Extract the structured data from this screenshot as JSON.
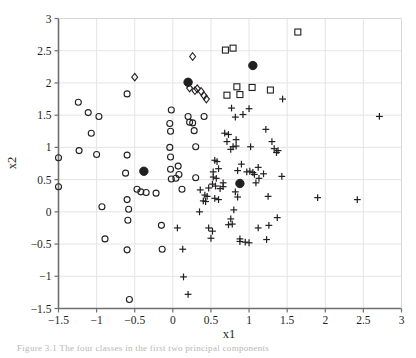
{
  "figure": {
    "background_color": "#ffffff",
    "axis_color": "#6f6f6f",
    "grid_color": "#e4e4e4",
    "marker_color": "#231f20",
    "caption": "Figure 3.1   The four classes in the first two principal components"
  },
  "chart_data": {
    "type": "scatter",
    "title": "",
    "xlabel": "x1",
    "ylabel": "x2",
    "xlim": [
      -1.5,
      3
    ],
    "ylim": [
      -1.5,
      3
    ],
    "xticks": [
      -1.5,
      -1,
      -0.5,
      0,
      0.5,
      1,
      1.5,
      2,
      2.5,
      3
    ],
    "xticklabels": [
      "-1.5",
      "-1",
      "-0.5",
      "0",
      "0.5",
      "1",
      "1.5",
      "2",
      "2.5",
      "3"
    ],
    "yticks": [
      -1.5,
      -1,
      -0.5,
      0,
      0.5,
      1,
      1.5,
      2,
      2.5,
      3
    ],
    "yticklabels": [
      "-1.5",
      "-1",
      "-0.5",
      "0",
      "0.5",
      "1",
      "1.5",
      "2",
      "2.5",
      "3"
    ],
    "grid": true,
    "legend": "none",
    "series": [
      {
        "name": "circle-class",
        "marker": "circle-open",
        "points": [
          [
            -1.5,
            0.84
          ],
          [
            -1.5,
            0.39
          ],
          [
            -1.24,
            1.7
          ],
          [
            -1.23,
            0.95
          ],
          [
            -1.11,
            1.54
          ],
          [
            -1.07,
            1.22
          ],
          [
            -1.0,
            0.89
          ],
          [
            -0.97,
            1.48
          ],
          [
            -0.93,
            0.08
          ],
          [
            -0.89,
            -0.42
          ],
          [
            -0.6,
            1.83
          ],
          [
            -0.6,
            0.88
          ],
          [
            -0.62,
            0.6
          ],
          [
            -0.6,
            0.19
          ],
          [
            -0.58,
            0.04
          ],
          [
            -0.59,
            -0.13
          ],
          [
            -0.6,
            -0.59
          ],
          [
            -0.57,
            -1.36
          ],
          [
            -0.47,
            0.35
          ],
          [
            -0.42,
            0.31
          ],
          [
            -0.35,
            0.3
          ],
          [
            -0.22,
            0.29
          ],
          [
            -0.15,
            -0.21
          ],
          [
            -0.14,
            -0.58
          ],
          [
            -0.02,
            1.58
          ],
          [
            -0.03,
            1.25
          ],
          [
            -0.04,
            1.37
          ],
          [
            -0.04,
            1.0
          ],
          [
            -0.03,
            0.85
          ],
          [
            -0.03,
            0.66
          ],
          [
            -0.02,
            0.51
          ],
          [
            0.04,
            0.52
          ],
          [
            0.07,
            0.71
          ],
          [
            0.08,
            0.58
          ],
          [
            0.12,
            0.35
          ],
          [
            0.2,
            1.48
          ],
          [
            0.22,
            1.39
          ],
          [
            0.26,
            1.38
          ],
          [
            0.28,
            1.26
          ],
          [
            0.3,
            1.01
          ],
          [
            0.3,
            0.53
          ],
          [
            0.41,
            1.48
          ]
        ]
      },
      {
        "name": "diamond-class",
        "marker": "diamond-open",
        "points": [
          [
            -0.5,
            2.09
          ],
          [
            0.26,
            2.41
          ],
          [
            0.22,
            1.92
          ],
          [
            0.32,
            1.91
          ],
          [
            0.37,
            1.87
          ],
          [
            0.41,
            1.8
          ],
          [
            0.44,
            1.75
          ],
          [
            0.29,
            1.88
          ]
        ]
      },
      {
        "name": "square-class",
        "marker": "square-open",
        "points": [
          [
            1.64,
            2.79
          ],
          [
            0.69,
            2.51
          ],
          [
            0.79,
            2.54
          ],
          [
            0.84,
            1.94
          ],
          [
            1.04,
            1.93
          ],
          [
            1.28,
            1.89
          ],
          [
            0.71,
            1.81
          ],
          [
            0.88,
            1.82
          ]
        ]
      },
      {
        "name": "plus-class",
        "marker": "plus",
        "points": [
          [
            2.71,
            1.48
          ],
          [
            1.44,
            1.75
          ],
          [
            1.22,
            1.28
          ],
          [
            1.3,
            1.09
          ],
          [
            1.33,
            0.98
          ],
          [
            1.38,
            0.95
          ],
          [
            1.36,
            0.92
          ],
          [
            1.0,
            1.6
          ],
          [
            0.92,
            1.51
          ],
          [
            0.77,
            1.61
          ],
          [
            0.82,
            1.47
          ],
          [
            0.68,
            1.22
          ],
          [
            0.73,
            1.2
          ],
          [
            0.71,
            1.09
          ],
          [
            0.83,
            1.12
          ],
          [
            0.79,
            1.01
          ],
          [
            0.83,
            1.02
          ],
          [
            0.76,
            0.97
          ],
          [
            0.55,
            0.8
          ],
          [
            0.58,
            0.78
          ],
          [
            0.6,
            0.67
          ],
          [
            0.53,
            0.62
          ],
          [
            0.53,
            0.54
          ],
          [
            0.57,
            0.52
          ],
          [
            0.85,
            0.64
          ],
          [
            0.97,
            0.62
          ],
          [
            1.01,
            0.63
          ],
          [
            1.05,
            0.61
          ],
          [
            1.07,
            0.58
          ],
          [
            1.19,
            0.59
          ],
          [
            1.13,
            0.52
          ],
          [
            1.43,
            0.55
          ],
          [
            0.47,
            0.37
          ],
          [
            0.52,
            0.43
          ],
          [
            0.56,
            0.4
          ],
          [
            0.62,
            0.36
          ],
          [
            0.66,
            0.39
          ],
          [
            0.36,
            0.34
          ],
          [
            0.42,
            0.26
          ],
          [
            0.45,
            0.24
          ],
          [
            0.4,
            0.17
          ],
          [
            0.43,
            0.16
          ],
          [
            0.55,
            0.21
          ],
          [
            0.6,
            0.19
          ],
          [
            0.82,
            0.31
          ],
          [
            0.85,
            0.23
          ],
          [
            1.25,
            0.24
          ],
          [
            1.9,
            0.22
          ],
          [
            2.42,
            0.19
          ],
          [
            0.35,
            0.0
          ],
          [
            0.8,
            0.03
          ],
          [
            0.76,
            -0.11
          ],
          [
            0.73,
            -0.2
          ],
          [
            0.78,
            -0.19
          ],
          [
            0.47,
            -0.25
          ],
          [
            0.52,
            -0.3
          ],
          [
            0.5,
            -0.41
          ],
          [
            0.88,
            -0.42
          ],
          [
            1.12,
            -0.25
          ],
          [
            1.26,
            -0.21
          ],
          [
            1.37,
            -0.09
          ],
          [
            0.88,
            -0.46
          ],
          [
            0.95,
            -0.47
          ],
          [
            1.0,
            -0.48
          ],
          [
            1.23,
            -0.43
          ],
          [
            0.06,
            -0.25
          ],
          [
            0.13,
            -0.58
          ],
          [
            0.14,
            -1.01
          ],
          [
            0.2,
            -1.28
          ],
          [
            1.02,
            1.01
          ],
          [
            0.9,
            0.74
          ],
          [
            1.12,
            0.69
          ],
          [
            0.66,
            0.45
          ],
          [
            1.09,
            0.45
          ]
        ]
      },
      {
        "name": "centroid",
        "marker": "circle-filled",
        "points": [
          [
            -0.38,
            0.63
          ],
          [
            0.2,
            2.01
          ],
          [
            1.05,
            2.27
          ],
          [
            0.88,
            0.44
          ]
        ]
      }
    ]
  }
}
